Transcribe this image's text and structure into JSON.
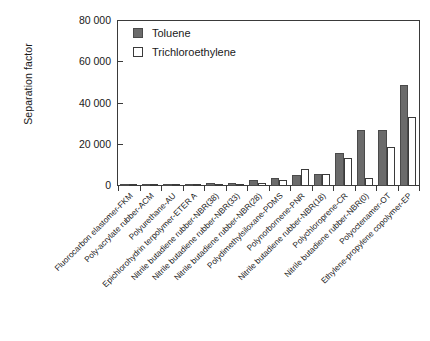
{
  "chart_data": {
    "type": "bar",
    "title": "",
    "xlabel": "",
    "ylabel": "Separation factor",
    "ylim": [
      0,
      80000
    ],
    "yticks": [
      0,
      20000,
      40000,
      60000,
      80000
    ],
    "ytick_labels": [
      "0",
      "20 000",
      "40 000",
      "60 000",
      "80 000"
    ],
    "grid": false,
    "legend_position": "top-left",
    "categories": [
      "Fluorocarbon elastomer-FKM",
      "Poly-acrylate rubber-ACM",
      "Polyurethane-AU",
      "Epichlorohydrin terpolymer-ETER A",
      "Nitrile butadiene rubber-NBR(38)",
      "Nitrile butadiene rubber-NBR(33)",
      "Nitrile butadiene rubber-NBR(28)",
      "Polydimethylsiloxane-PDMS",
      "Polynorbornene-PNR",
      "Nitrile butadiene rubber-NBR(18)",
      "Polychloroprene-CR",
      "Nitrile butadiene rubber-NBR(0)",
      "Polyoctenamer-OT",
      "Ethylene-propylene copolymer-EP"
    ],
    "series": [
      {
        "name": "Toluene",
        "color": "#6b6b6b",
        "values": [
          300,
          300,
          300,
          600,
          1500,
          1600,
          3000,
          3900,
          5300,
          5700,
          16000,
          27000,
          27000,
          49000
        ]
      },
      {
        "name": "Trichloroethylene",
        "color": "#ffffff",
        "values": [
          200,
          200,
          250,
          450,
          900,
          800,
          1700,
          2800,
          8200,
          5700,
          13500,
          3700,
          19000,
          33500
        ]
      }
    ]
  },
  "legend": {
    "items": [
      {
        "label": "Toluene"
      },
      {
        "label": "Trichloroethylene"
      }
    ]
  }
}
